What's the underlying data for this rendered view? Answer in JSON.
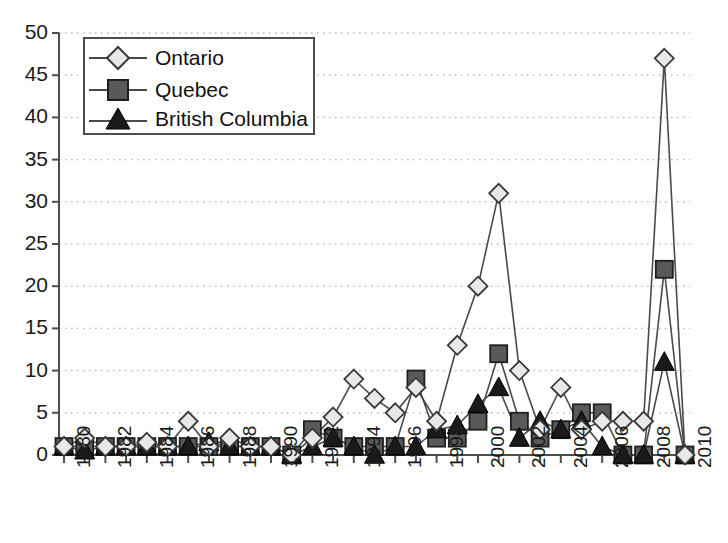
{
  "chart_data": {
    "type": "line",
    "title": "",
    "xlabel": "",
    "ylabel": "",
    "ylim": [
      0,
      50
    ],
    "ytick_step": 5,
    "yticks": [
      50,
      45,
      40,
      35,
      30,
      25,
      20,
      15,
      10,
      5,
      0
    ],
    "xlim": [
      1980,
      2010
    ],
    "xticks": [
      1980,
      1982,
      1984,
      1986,
      1988,
      1990,
      1992,
      1994,
      1996,
      1998,
      2000,
      2002,
      2004,
      2006,
      2008,
      2010
    ],
    "xtick_labels": [
      "1980",
      "1982",
      "1984",
      "1986",
      "1988",
      "1990",
      "1992",
      "1994",
      "1996",
      "1998",
      "2000",
      "2002",
      "2004",
      "2006",
      "2008",
      "2010"
    ],
    "x": [
      1980,
      1981,
      1982,
      1983,
      1984,
      1985,
      1986,
      1987,
      1988,
      1989,
      1990,
      1991,
      1992,
      1993,
      1994,
      1995,
      1996,
      1997,
      1998,
      1999,
      2000,
      2001,
      2002,
      2003,
      2004,
      2005,
      2006,
      2007,
      2008,
      2009,
      2010
    ],
    "grid": "horizontal-dotted",
    "legend_position": "upper-left",
    "series": [
      {
        "name": "Ontario",
        "marker": "diamond",
        "marker_fill": "#e8e8e8",
        "values": [
          1,
          2,
          1,
          1,
          1.5,
          1,
          4,
          1,
          2,
          1,
          1,
          0,
          2,
          4.5,
          9,
          6.7,
          5,
          8,
          4,
          13,
          20,
          31,
          10,
          3,
          8,
          3,
          4,
          4,
          4,
          47,
          0
        ]
      },
      {
        "name": "Quebec",
        "marker": "square",
        "marker_fill": "#595959",
        "values": [
          1,
          1,
          1,
          1,
          1,
          1,
          1,
          1,
          1,
          1,
          1,
          0,
          3,
          2,
          1,
          1,
          1,
          9,
          2,
          2,
          4,
          12,
          4,
          2,
          3,
          5,
          5,
          0,
          0,
          22,
          0
        ]
      },
      {
        "name": "British Columbia",
        "marker": "triangle",
        "marker_fill": "#1a1a1a",
        "values": [
          1,
          0.5,
          1,
          1,
          1,
          1,
          1,
          1.5,
          1,
          1,
          1,
          0,
          1,
          2,
          1,
          0,
          1,
          1,
          3,
          3.5,
          6,
          8,
          2,
          4,
          3,
          4,
          1,
          0,
          0,
          11,
          0
        ]
      }
    ]
  },
  "legend": {
    "items": [
      {
        "label": "Ontario",
        "marker": "diamond-marker-icon"
      },
      {
        "label": "Quebec",
        "marker": "square-marker-icon"
      },
      {
        "label": "British Columbia",
        "marker": "triangle-marker-icon"
      }
    ]
  },
  "colors": {
    "axis": "#4d4d4d",
    "line": "#4a4a4a",
    "grid": "#b8b8b8",
    "ontario_fill": "#e8e8e8",
    "quebec_fill": "#595959",
    "bc_fill": "#1a1a1a",
    "text": "#1a1a1a"
  }
}
